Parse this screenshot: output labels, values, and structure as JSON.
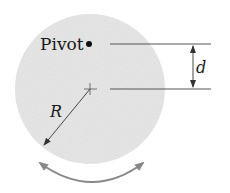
{
  "diagram": {
    "labels": {
      "pivot": "Pivot",
      "distance": "d",
      "radius": "R"
    },
    "elements": {
      "disk": {
        "cx": 90,
        "cy": 89,
        "r": 75,
        "fill": "#e8e8e8"
      },
      "pivot_point": {
        "cx": 89,
        "cy": 44
      },
      "center_mark": {
        "cx": 90,
        "cy": 89
      },
      "upper_reference_line": {
        "x1": 110,
        "x2": 211,
        "y": 44
      },
      "lower_reference_line": {
        "x1": 110,
        "x2": 211,
        "y": 89
      },
      "distance_arrow": {
        "x": 193,
        "y1": 44,
        "y2": 89
      },
      "radius_arrow": {
        "x1": 90,
        "y1": 89,
        "x2": 43,
        "y2": 146
      },
      "oscillation_arrow": {
        "description": "double-headed curved arrow below disk"
      }
    },
    "colors": {
      "disk": "#e8e8e8",
      "lines": "#555555",
      "oscillation_arrow": "#888888",
      "text": "#1a1a1a"
    }
  }
}
